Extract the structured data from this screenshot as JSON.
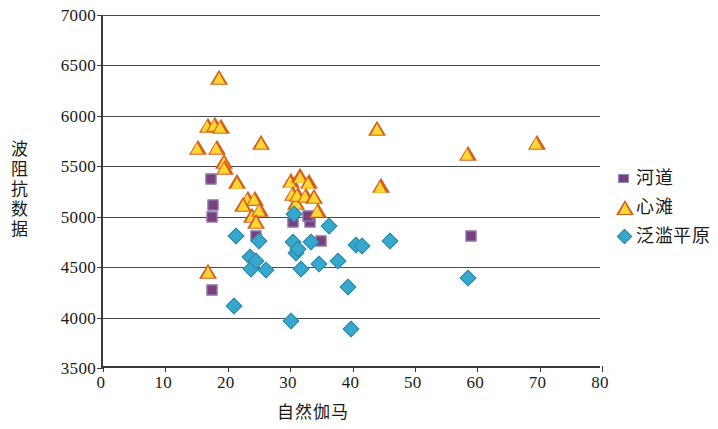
{
  "chart_data": {
    "type": "scatter",
    "title": "",
    "xlabel": "自然伽马",
    "ylabel": "波阻抗数据",
    "xlim": [
      0,
      80
    ],
    "ylim": [
      3500,
      7000
    ],
    "xticks": [
      0,
      10,
      20,
      30,
      40,
      50,
      60,
      70,
      80
    ],
    "yticks": [
      3500,
      4000,
      4500,
      5000,
      5500,
      6000,
      6500,
      7000
    ],
    "grid": "horizontal",
    "legend_position": "right",
    "series": [
      {
        "name": "河道",
        "marker": "square",
        "color": "#7C3F7E",
        "border_color": "#8E8EC0",
        "points": [
          [
            17.3,
            5370
          ],
          [
            17.6,
            5120
          ],
          [
            17.5,
            5000
          ],
          [
            17.4,
            4270
          ],
          [
            24.5,
            4810
          ],
          [
            30.5,
            4950
          ],
          [
            33.2,
            4950
          ],
          [
            32.9,
            5010
          ],
          [
            35.0,
            4755
          ],
          [
            59.0,
            4805
          ]
        ]
      },
      {
        "name": "心滩",
        "marker": "triangle",
        "color": "#FFD633",
        "border_color": "#D4601E",
        "points": [
          [
            18.6,
            6380
          ],
          [
            16.8,
            5900
          ],
          [
            17.9,
            5910
          ],
          [
            18.9,
            5890
          ],
          [
            15.2,
            5680
          ],
          [
            18.2,
            5680
          ],
          [
            19.4,
            5540
          ],
          [
            19.5,
            5480
          ],
          [
            25.4,
            5730
          ],
          [
            21.5,
            5340
          ],
          [
            23.2,
            5180
          ],
          [
            24.3,
            5180
          ],
          [
            22.5,
            5120
          ],
          [
            23.9,
            5010
          ],
          [
            25.1,
            5070
          ],
          [
            24.6,
            4950
          ],
          [
            16.9,
            4450
          ],
          [
            30.1,
            5350
          ],
          [
            30.4,
            5230
          ],
          [
            31.0,
            5140
          ],
          [
            31.2,
            5220
          ],
          [
            31.6,
            5400
          ],
          [
            33.0,
            5340
          ],
          [
            32.5,
            5210
          ],
          [
            33.9,
            5200
          ],
          [
            34.4,
            5060
          ],
          [
            44.0,
            5870
          ],
          [
            44.5,
            5300
          ],
          [
            58.5,
            5620
          ],
          [
            69.5,
            5730
          ]
        ]
      },
      {
        "name": "泛滥平原",
        "marker": "diamond",
        "color": "#36A8CE",
        "border_color": "#2E86A8",
        "points": [
          [
            21.3,
            4810
          ],
          [
            21.0,
            4110
          ],
          [
            23.6,
            4600
          ],
          [
            23.8,
            4480
          ],
          [
            24.6,
            4560
          ],
          [
            25.0,
            4760
          ],
          [
            26.1,
            4470
          ],
          [
            30.6,
            5030
          ],
          [
            30.4,
            4750
          ],
          [
            31.0,
            4640
          ],
          [
            31.2,
            4680
          ],
          [
            30.2,
            3970
          ],
          [
            31.8,
            4480
          ],
          [
            33.4,
            4750
          ],
          [
            34.6,
            4530
          ],
          [
            36.3,
            4910
          ],
          [
            37.6,
            4560
          ],
          [
            39.2,
            4300
          ],
          [
            39.8,
            3890
          ],
          [
            40.6,
            4720
          ],
          [
            41.6,
            4710
          ],
          [
            46.0,
            4760
          ],
          [
            58.5,
            4390
          ]
        ]
      }
    ]
  },
  "axes": {
    "y_tick_labels": [
      "7000",
      "6500",
      "6000",
      "5500",
      "5000",
      "4500",
      "4000",
      "3500"
    ],
    "x_tick_labels": [
      "0",
      "10",
      "20",
      "30",
      "40",
      "50",
      "60",
      "70",
      "80"
    ],
    "x_title": "自然伽马",
    "y_title": "波阻抗数据"
  },
  "legend": {
    "items": [
      {
        "label": "河道",
        "marker": "square-marker-icon"
      },
      {
        "label": "心滩",
        "marker": "triangle-marker-icon"
      },
      {
        "label": "泛滥平原",
        "marker": "diamond-marker-icon"
      }
    ]
  }
}
